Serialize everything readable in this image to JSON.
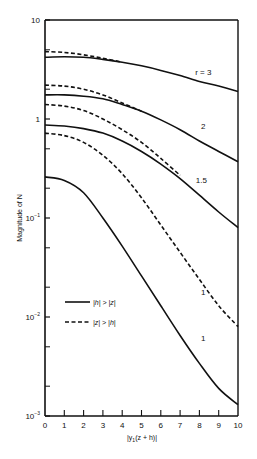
{
  "chart_data": {
    "type": "line",
    "title": "",
    "xlabel": "|y1(z + h)|",
    "ylabel": "Magnitude of N",
    "xlim": [
      0,
      10
    ],
    "ylim": [
      0.001,
      10
    ],
    "yscale": "log",
    "grid": false,
    "x_ticks": [
      "0",
      "1",
      "2",
      "3",
      "4",
      "5",
      "6",
      "7",
      "8",
      "9",
      "10"
    ],
    "y_ticks": [
      {
        "value": 10,
        "label": "10"
      },
      {
        "value": 1,
        "label": "1"
      },
      {
        "value": 0.1,
        "label": "10",
        "exp": "−1"
      },
      {
        "value": 0.01,
        "label": "10",
        "exp": "−2"
      },
      {
        "value": 0.001,
        "label": "10",
        "exp": "−3"
      }
    ],
    "legend": {
      "position": "lower-left",
      "entries": [
        {
          "style": "solid",
          "label": "|h| > |z|"
        },
        {
          "style": "dashed",
          "label": "|z| > |h|"
        }
      ]
    },
    "x": [
      0,
      1,
      2,
      3,
      4,
      5,
      6,
      7,
      8,
      9,
      10
    ],
    "series": [
      {
        "name": "r=3 solid",
        "style": "solid",
        "r": "3",
        "values": [
          4.2,
          4.25,
          4.2,
          4.0,
          3.75,
          3.45,
          3.1,
          2.75,
          2.4,
          2.15,
          1.9
        ]
      },
      {
        "name": "r=3 dashed",
        "style": "dashed",
        "r": "3",
        "values": [
          4.8,
          4.7,
          4.45,
          4.1,
          3.75,
          null,
          null,
          null,
          null,
          null,
          null
        ]
      },
      {
        "name": "r=2 solid",
        "style": "solid",
        "r": "2",
        "values": [
          1.75,
          1.75,
          1.7,
          1.6,
          1.4,
          1.2,
          0.98,
          0.78,
          0.6,
          0.47,
          0.37
        ]
      },
      {
        "name": "r=2 dashed",
        "style": "dashed",
        "r": "2",
        "values": [
          2.2,
          2.15,
          2.0,
          1.75,
          1.45,
          1.2,
          null,
          null,
          null,
          null,
          null
        ]
      },
      {
        "name": "r=1.5 solid",
        "style": "solid",
        "r": "1.5",
        "values": [
          0.87,
          0.85,
          0.8,
          0.72,
          0.6,
          0.47,
          0.35,
          0.25,
          0.17,
          0.115,
          0.08
        ]
      },
      {
        "name": "r=1.5 dashed",
        "style": "dashed",
        "r": "1.5",
        "values": [
          1.4,
          1.35,
          1.22,
          1.0,
          0.78,
          0.58,
          0.4,
          0.27,
          null,
          null,
          null
        ]
      },
      {
        "name": "r=1 dashed",
        "style": "dashed",
        "r": "1",
        "values": [
          0.72,
          0.68,
          0.58,
          0.43,
          0.28,
          0.16,
          0.085,
          0.045,
          0.024,
          0.013,
          0.008
        ]
      },
      {
        "name": "r=1 solid",
        "style": "solid",
        "r": "1",
        "values": [
          0.26,
          0.24,
          0.18,
          0.1,
          0.052,
          0.026,
          0.013,
          0.0065,
          0.0034,
          0.0019,
          0.0013
        ]
      }
    ],
    "annotations": [
      {
        "text": "r = 3",
        "x": 8.2,
        "y": 3.0
      },
      {
        "text": "2",
        "x": 8.2,
        "y": 0.85
      },
      {
        "text": "1.5",
        "x": 8.1,
        "y": 0.24
      },
      {
        "text": "1",
        "x": 8.2,
        "y": 0.018
      },
      {
        "text": "1",
        "x": 8.2,
        "y": 0.0062
      }
    ]
  },
  "axis": {
    "ylabel": "Magnitude of N",
    "xlabel_prefix": "|y",
    "xlabel_sub": "1",
    "xlabel_suffix": "(z + h)|"
  },
  "legend": {
    "solid_label": "|h| > |z|",
    "dashed_label": "|z| > |h|"
  }
}
